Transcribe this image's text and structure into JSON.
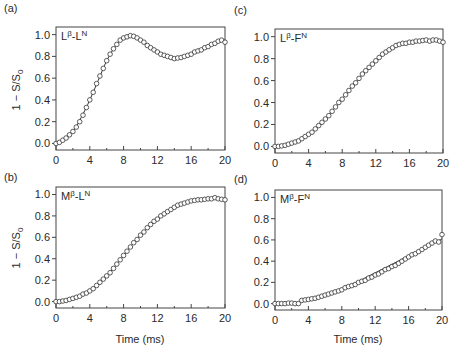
{
  "figure": {
    "xlabel": "Time (ms)",
    "ylabel": "1 − S/S0",
    "ylabel_main": "1 − S/S",
    "ylabel_sub": "0"
  },
  "chart_data": [
    {
      "panel": "(a)",
      "type": "scatter",
      "annotation": {
        "base": "L",
        "sup1": "β",
        "mid": "-L",
        "sup2": "N"
      },
      "title": "Lβ-LN",
      "xlabel": "",
      "ylabel": "1 − S/S0",
      "xlim": [
        0,
        20
      ],
      "ylim": [
        -0.06,
        1.07
      ],
      "xticks": [
        0,
        4,
        8,
        12,
        16,
        20
      ],
      "yticks": [
        0.0,
        0.2,
        0.4,
        0.6,
        0.8,
        1.0
      ],
      "ytick_labels": [
        "0.0",
        "0.2",
        "0.4",
        "0.6",
        "0.8",
        "1.0"
      ],
      "series": [
        {
          "name": "data (open circles)",
          "marker": "circle-open",
          "x": [
            0,
            0.4,
            0.8,
            1.2,
            1.6,
            2.0,
            2.4,
            2.8,
            3.2,
            3.6,
            4.0,
            4.4,
            4.8,
            5.2,
            5.6,
            6.0,
            6.4,
            6.8,
            7.2,
            7.6,
            8.0,
            8.4,
            8.8,
            9.2,
            9.6,
            10.0,
            10.4,
            10.8,
            11.2,
            11.6,
            12.0,
            12.4,
            12.8,
            13.2,
            13.6,
            14.0,
            14.4,
            14.8,
            15.2,
            15.6,
            16.0,
            16.4,
            16.8,
            17.2,
            17.6,
            18.0,
            18.4,
            18.8,
            19.2,
            19.6,
            20.0
          ],
          "y": [
            0.0,
            0.01,
            0.03,
            0.05,
            0.08,
            0.11,
            0.15,
            0.2,
            0.26,
            0.33,
            0.4,
            0.47,
            0.55,
            0.62,
            0.69,
            0.76,
            0.82,
            0.87,
            0.91,
            0.95,
            0.97,
            0.98,
            0.99,
            0.985,
            0.97,
            0.95,
            0.93,
            0.9,
            0.88,
            0.86,
            0.84,
            0.82,
            0.81,
            0.8,
            0.79,
            0.78,
            0.785,
            0.79,
            0.8,
            0.81,
            0.82,
            0.84,
            0.85,
            0.86,
            0.88,
            0.89,
            0.91,
            0.92,
            0.94,
            0.95,
            0.93
          ]
        },
        {
          "name": "fit (line)",
          "marker": "line",
          "x": [
            0,
            1,
            2,
            3,
            4,
            5,
            6,
            7,
            8,
            9,
            10,
            11,
            12,
            13,
            14,
            15,
            16,
            17,
            18,
            19,
            20
          ],
          "y": [
            0.0,
            0.04,
            0.11,
            0.24,
            0.4,
            0.58,
            0.76,
            0.89,
            0.97,
            0.99,
            0.95,
            0.9,
            0.85,
            0.81,
            0.79,
            0.8,
            0.83,
            0.86,
            0.89,
            0.92,
            0.95
          ]
        }
      ]
    },
    {
      "panel": "(c)",
      "type": "scatter",
      "annotation": {
        "base": "L",
        "sup1": "β",
        "mid": "-F",
        "sup2": "N"
      },
      "title": "Lβ-FN",
      "xlabel": "",
      "ylabel": "",
      "xlim": [
        0,
        20
      ],
      "ylim": [
        -0.06,
        1.07
      ],
      "xticks": [
        0,
        4,
        8,
        12,
        16,
        20
      ],
      "yticks": [
        0.0,
        0.2,
        0.4,
        0.6,
        0.8,
        1.0
      ],
      "ytick_labels": [
        "0.0",
        "0.2",
        "0.4",
        "0.6",
        "0.8",
        "1.0"
      ],
      "series": [
        {
          "name": "data (open circles)",
          "marker": "circle-open",
          "x": [
            0,
            0.4,
            0.8,
            1.2,
            1.6,
            2.0,
            2.4,
            2.8,
            3.2,
            3.6,
            4.0,
            4.4,
            4.8,
            5.2,
            5.6,
            6.0,
            6.4,
            6.8,
            7.2,
            7.6,
            8.0,
            8.4,
            8.8,
            9.2,
            9.6,
            10.0,
            10.4,
            10.8,
            11.2,
            11.6,
            12.0,
            12.4,
            12.8,
            13.2,
            13.6,
            14.0,
            14.4,
            14.8,
            15.2,
            15.6,
            16.0,
            16.4,
            16.8,
            17.2,
            17.6,
            18.0,
            18.4,
            18.8,
            19.2,
            19.6,
            20.0
          ],
          "y": [
            0.0,
            0.0,
            0.005,
            0.01,
            0.02,
            0.03,
            0.04,
            0.05,
            0.07,
            0.09,
            0.11,
            0.13,
            0.16,
            0.19,
            0.22,
            0.25,
            0.28,
            0.32,
            0.36,
            0.4,
            0.43,
            0.47,
            0.51,
            0.55,
            0.58,
            0.62,
            0.66,
            0.69,
            0.72,
            0.75,
            0.78,
            0.81,
            0.84,
            0.86,
            0.88,
            0.9,
            0.92,
            0.93,
            0.94,
            0.94,
            0.95,
            0.95,
            0.96,
            0.96,
            0.965,
            0.97,
            0.96,
            0.97,
            0.97,
            0.96,
            0.95
          ]
        },
        {
          "name": "fit (line)",
          "marker": "line",
          "x": [
            0,
            1,
            2,
            3,
            4,
            5,
            6,
            7,
            8,
            9,
            10,
            11,
            12,
            13,
            14,
            15,
            16,
            17,
            18,
            19,
            20
          ],
          "y": [
            0.0,
            0.01,
            0.03,
            0.06,
            0.11,
            0.17,
            0.25,
            0.34,
            0.43,
            0.53,
            0.62,
            0.7,
            0.78,
            0.84,
            0.89,
            0.93,
            0.95,
            0.96,
            0.965,
            0.965,
            0.96
          ]
        }
      ]
    },
    {
      "panel": "(b)",
      "type": "scatter",
      "annotation": {
        "base": "M",
        "sup1": "β",
        "mid": "-L",
        "sup2": "N"
      },
      "title": "Mβ-LN",
      "xlabel": "Time (ms)",
      "ylabel": "1 − S/S0",
      "xlim": [
        0,
        20
      ],
      "ylim": [
        -0.06,
        1.07
      ],
      "xticks": [
        0,
        4,
        8,
        12,
        16,
        20
      ],
      "yticks": [
        0.0,
        0.2,
        0.4,
        0.6,
        0.8,
        1.0
      ],
      "ytick_labels": [
        "0.0",
        "0.2",
        "0.4",
        "0.6",
        "0.8",
        "1.0"
      ],
      "series": [
        {
          "name": "data (open circles)",
          "marker": "circle-open",
          "x": [
            0,
            0.4,
            0.8,
            1.2,
            1.6,
            2.0,
            2.4,
            2.8,
            3.2,
            3.6,
            4.0,
            4.4,
            4.8,
            5.2,
            5.6,
            6.0,
            6.4,
            6.8,
            7.2,
            7.6,
            8.0,
            8.4,
            8.8,
            9.2,
            9.6,
            10.0,
            10.4,
            10.8,
            11.2,
            11.6,
            12.0,
            12.4,
            12.8,
            13.2,
            13.6,
            14.0,
            14.4,
            14.8,
            15.2,
            15.6,
            16.0,
            16.4,
            16.8,
            17.2,
            17.6,
            18.0,
            18.4,
            18.8,
            19.2,
            19.6,
            20.0
          ],
          "y": [
            0.0,
            0.0,
            0.005,
            0.01,
            0.02,
            0.03,
            0.04,
            0.05,
            0.07,
            0.08,
            0.1,
            0.12,
            0.15,
            0.18,
            0.21,
            0.24,
            0.27,
            0.31,
            0.35,
            0.39,
            0.43,
            0.47,
            0.51,
            0.55,
            0.58,
            0.62,
            0.65,
            0.69,
            0.72,
            0.75,
            0.77,
            0.8,
            0.82,
            0.84,
            0.86,
            0.88,
            0.9,
            0.91,
            0.92,
            0.93,
            0.94,
            0.945,
            0.95,
            0.95,
            0.955,
            0.96,
            0.96,
            0.97,
            0.96,
            0.955,
            0.95
          ]
        },
        {
          "name": "fit (line)",
          "marker": "line",
          "x": [
            0,
            1,
            2,
            3,
            4,
            5,
            6,
            7,
            8,
            9,
            10,
            11,
            12,
            13,
            14,
            15,
            16,
            17,
            18,
            19,
            20
          ],
          "y": [
            0.0,
            0.01,
            0.03,
            0.06,
            0.1,
            0.16,
            0.24,
            0.33,
            0.43,
            0.53,
            0.62,
            0.7,
            0.77,
            0.83,
            0.87,
            0.91,
            0.93,
            0.95,
            0.96,
            0.96,
            0.955
          ]
        }
      ]
    },
    {
      "panel": "(d)",
      "type": "scatter",
      "annotation": {
        "base": "M",
        "sup1": "β",
        "mid": "-F",
        "sup2": "N"
      },
      "title": "Mβ-FN",
      "xlabel": "Time (ms)",
      "ylabel": "",
      "xlim": [
        0,
        20
      ],
      "ylim": [
        -0.06,
        1.07
      ],
      "xticks": [
        0,
        4,
        8,
        12,
        16,
        20
      ],
      "yticks": [
        0.0,
        0.2,
        0.4,
        0.6,
        0.8,
        1.0
      ],
      "ytick_labels": [
        "0.0",
        "0.2",
        "0.4",
        "0.6",
        "0.8",
        "1.0"
      ],
      "series": [
        {
          "name": "data (open circles)",
          "marker": "circle-open",
          "x": [
            0,
            0.4,
            0.8,
            1.2,
            1.6,
            2.0,
            2.4,
            2.8,
            3.2,
            3.6,
            4.0,
            4.4,
            4.8,
            5.2,
            5.6,
            6.0,
            6.4,
            6.8,
            7.2,
            7.6,
            8.0,
            8.4,
            8.8,
            9.2,
            9.6,
            10.0,
            10.4,
            10.8,
            11.2,
            11.6,
            12.0,
            12.4,
            12.8,
            13.2,
            13.6,
            14.0,
            14.4,
            14.8,
            15.2,
            15.6,
            16.0,
            16.4,
            16.8,
            17.2,
            17.6,
            18.0,
            18.4,
            18.8,
            19.2,
            19.6,
            20.0
          ],
          "y": [
            0.0,
            0.0,
            0.0,
            0.0,
            0.005,
            0.005,
            0.0,
            0.0,
            0.03,
            0.035,
            0.04,
            0.045,
            0.05,
            0.06,
            0.07,
            0.08,
            0.09,
            0.1,
            0.11,
            0.12,
            0.13,
            0.15,
            0.16,
            0.17,
            0.18,
            0.2,
            0.21,
            0.22,
            0.24,
            0.25,
            0.27,
            0.28,
            0.3,
            0.32,
            0.33,
            0.35,
            0.36,
            0.38,
            0.4,
            0.42,
            0.44,
            0.46,
            0.47,
            0.49,
            0.51,
            0.53,
            0.55,
            0.57,
            0.59,
            0.58,
            0.65
          ]
        },
        {
          "name": "fit (line)",
          "marker": "line",
          "x": [
            0,
            1,
            2,
            3,
            4,
            5,
            6,
            7,
            8,
            9,
            10,
            11,
            12,
            13,
            14,
            15,
            16,
            17,
            18,
            19,
            20
          ],
          "y": [
            0.0,
            0.0,
            0.005,
            0.015,
            0.03,
            0.05,
            0.08,
            0.11,
            0.14,
            0.17,
            0.21,
            0.25,
            0.29,
            0.33,
            0.37,
            0.41,
            0.45,
            0.49,
            0.53,
            0.57,
            0.61
          ]
        }
      ]
    }
  ]
}
